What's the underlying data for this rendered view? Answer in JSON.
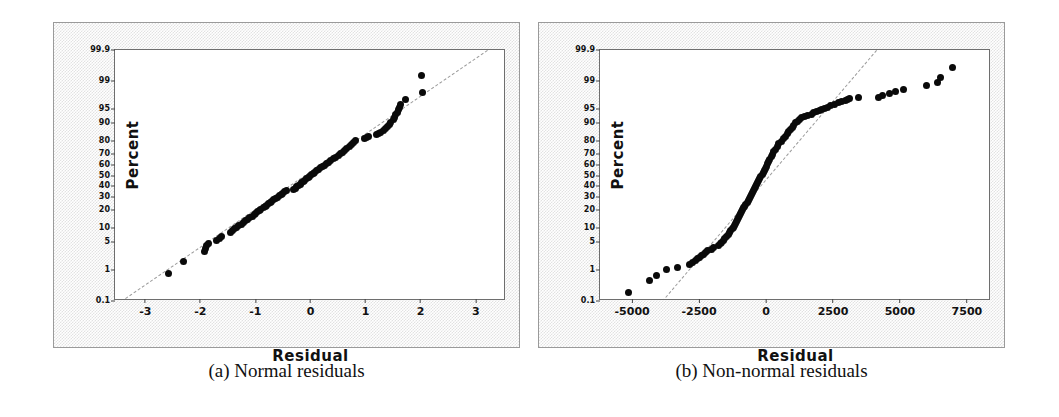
{
  "figure": {
    "panels": [
      {
        "id": "a",
        "caption": "(a) Normal residuals",
        "xlabel": "Residual",
        "ylabel": "Percent"
      },
      {
        "id": "b",
        "caption": "(b) Non-normal residuals",
        "xlabel": "Residual",
        "ylabel": "Percent"
      }
    ]
  },
  "chart_data": [
    {
      "type": "scatter",
      "subplot": "a",
      "title": "(a) Normal residuals",
      "xlabel": "Residual",
      "ylabel": "Percent",
      "xlim": [
        -3.55,
        3.55
      ],
      "ylim": [
        0.1,
        99.9
      ],
      "yscale": "normal-probability",
      "grid": false,
      "legend": null,
      "xticks": [
        -3,
        -2,
        -1,
        0,
        1,
        2,
        3
      ],
      "xticklabels": [
        "-3",
        "-2",
        "-1",
        "0",
        "1",
        "2",
        "3"
      ],
      "yticks": [
        0.1,
        1,
        5,
        10,
        20,
        30,
        40,
        50,
        60,
        70,
        80,
        90,
        95,
        99,
        99.9
      ],
      "yticklabels": [
        "0.1",
        "1",
        "5",
        "10",
        "20",
        "30",
        "40",
        "50",
        "60",
        "70",
        "80",
        "90",
        "95",
        "99",
        "99.9"
      ],
      "reference_line": {
        "style": "dashed",
        "color": "#9b9b9b",
        "x": [
          -3.45,
          3.2
        ],
        "y": [
          0.1,
          99.9
        ]
      },
      "points": [
        {
          "x": -2.58,
          "y": 0.8
        },
        {
          "x": -2.3,
          "y": 1.7
        },
        {
          "x": -1.93,
          "y": 3.0
        },
        {
          "x": -1.9,
          "y": 3.6
        },
        {
          "x": -1.88,
          "y": 4.2
        },
        {
          "x": -1.86,
          "y": 4.6
        },
        {
          "x": -1.7,
          "y": 5.6
        },
        {
          "x": -1.66,
          "y": 6.1
        },
        {
          "x": -1.62,
          "y": 6.6
        },
        {
          "x": -1.45,
          "y": 8.2
        },
        {
          "x": -1.42,
          "y": 8.8
        },
        {
          "x": -1.38,
          "y": 9.4
        },
        {
          "x": -1.34,
          "y": 10.1
        },
        {
          "x": -1.3,
          "y": 10.8
        },
        {
          "x": -1.26,
          "y": 11.6
        },
        {
          "x": -1.22,
          "y": 12.4
        },
        {
          "x": -1.18,
          "y": 13.2
        },
        {
          "x": -1.14,
          "y": 14.0
        },
        {
          "x": -1.1,
          "y": 14.9
        },
        {
          "x": -1.06,
          "y": 15.8
        },
        {
          "x": -1.02,
          "y": 16.7
        },
        {
          "x": -0.99,
          "y": 17.6
        },
        {
          "x": -0.96,
          "y": 18.5
        },
        {
          "x": -0.93,
          "y": 19.4
        },
        {
          "x": -0.9,
          "y": 20.3
        },
        {
          "x": -0.86,
          "y": 21.3
        },
        {
          "x": -0.82,
          "y": 22.3
        },
        {
          "x": -0.79,
          "y": 23.3
        },
        {
          "x": -0.76,
          "y": 24.3
        },
        {
          "x": -0.73,
          "y": 25.4
        },
        {
          "x": -0.7,
          "y": 26.4
        },
        {
          "x": -0.67,
          "y": 27.5
        },
        {
          "x": -0.64,
          "y": 28.6
        },
        {
          "x": -0.6,
          "y": 29.7
        },
        {
          "x": -0.57,
          "y": 30.8
        },
        {
          "x": -0.53,
          "y": 32.0
        },
        {
          "x": -0.5,
          "y": 33.1
        },
        {
          "x": -0.47,
          "y": 34.3
        },
        {
          "x": -0.44,
          "y": 35.5
        },
        {
          "x": -0.3,
          "y": 36.7
        },
        {
          "x": -0.28,
          "y": 37.9
        },
        {
          "x": -0.26,
          "y": 39.1
        },
        {
          "x": -0.22,
          "y": 40.3
        },
        {
          "x": -0.19,
          "y": 41.6
        },
        {
          "x": -0.16,
          "y": 42.8
        },
        {
          "x": -0.13,
          "y": 44.1
        },
        {
          "x": -0.1,
          "y": 45.4
        },
        {
          "x": -0.07,
          "y": 46.7
        },
        {
          "x": -0.04,
          "y": 48.0
        },
        {
          "x": -0.01,
          "y": 49.3
        },
        {
          "x": 0.02,
          "y": 50.6
        },
        {
          "x": 0.05,
          "y": 52.0
        },
        {
          "x": 0.08,
          "y": 53.3
        },
        {
          "x": 0.11,
          "y": 54.7
        },
        {
          "x": 0.15,
          "y": 56.0
        },
        {
          "x": 0.18,
          "y": 57.4
        },
        {
          "x": 0.21,
          "y": 58.8
        },
        {
          "x": 0.25,
          "y": 60.2
        },
        {
          "x": 0.29,
          "y": 61.6
        },
        {
          "x": 0.33,
          "y": 63.0
        },
        {
          "x": 0.37,
          "y": 64.4
        },
        {
          "x": 0.41,
          "y": 65.9
        },
        {
          "x": 0.45,
          "y": 67.3
        },
        {
          "x": 0.5,
          "y": 68.8
        },
        {
          "x": 0.54,
          "y": 70.3
        },
        {
          "x": 0.58,
          "y": 71.8
        },
        {
          "x": 0.62,
          "y": 73.3
        },
        {
          "x": 0.66,
          "y": 74.8
        },
        {
          "x": 0.7,
          "y": 76.4
        },
        {
          "x": 0.74,
          "y": 77.9
        },
        {
          "x": 0.78,
          "y": 79.5
        },
        {
          "x": 0.82,
          "y": 80.6
        },
        {
          "x": 0.98,
          "y": 81.6
        },
        {
          "x": 1.02,
          "y": 82.4
        },
        {
          "x": 1.06,
          "y": 83.2
        },
        {
          "x": 1.2,
          "y": 84.2
        },
        {
          "x": 1.24,
          "y": 84.9
        },
        {
          "x": 1.28,
          "y": 85.7
        },
        {
          "x": 1.33,
          "y": 86.8
        },
        {
          "x": 1.36,
          "y": 87.7
        },
        {
          "x": 1.4,
          "y": 88.6
        },
        {
          "x": 1.43,
          "y": 89.6
        },
        {
          "x": 1.46,
          "y": 90.5
        },
        {
          "x": 1.5,
          "y": 91.5
        },
        {
          "x": 1.53,
          "y": 92.4
        },
        {
          "x": 1.55,
          "y": 93.2
        },
        {
          "x": 1.58,
          "y": 94.1
        },
        {
          "x": 1.6,
          "y": 94.8
        },
        {
          "x": 1.62,
          "y": 95.4
        },
        {
          "x": 1.64,
          "y": 96.0
        },
        {
          "x": 1.72,
          "y": 97.0
        },
        {
          "x": 2.03,
          "y": 98.0
        },
        {
          "x": 2.02,
          "y": 99.3
        }
      ]
    },
    {
      "type": "scatter",
      "subplot": "b",
      "title": "(b) Non-normal residuals",
      "xlabel": "Residual",
      "ylabel": "Percent",
      "xlim": [
        -6200,
        8400
      ],
      "ylim": [
        0.1,
        99.9
      ],
      "yscale": "normal-probability",
      "grid": false,
      "legend": null,
      "xticks": [
        -5000,
        -2500,
        0,
        2500,
        5000,
        7500
      ],
      "xticklabels": [
        "-5000",
        "-2500",
        "0",
        "2500",
        "5000",
        "7500"
      ],
      "yticks": [
        0.1,
        1,
        5,
        10,
        20,
        30,
        40,
        50,
        60,
        70,
        80,
        90,
        95,
        99,
        99.9
      ],
      "yticklabels": [
        "0.1",
        "1",
        "5",
        "10",
        "20",
        "30",
        "40",
        "50",
        "60",
        "70",
        "80",
        "90",
        "95",
        "99",
        "99.9"
      ],
      "reference_line": {
        "style": "dashed",
        "color": "#9b9b9b",
        "x": [
          -3900,
          4100
        ],
        "y": [
          0.1,
          99.9
        ]
      },
      "points": [
        {
          "x": -5150,
          "y": 0.2
        },
        {
          "x": -4350,
          "y": 0.5
        },
        {
          "x": -4100,
          "y": 0.7
        },
        {
          "x": -3700,
          "y": 1.0
        },
        {
          "x": -3300,
          "y": 1.2
        },
        {
          "x": -2850,
          "y": 1.4
        },
        {
          "x": -2750,
          "y": 1.6
        },
        {
          "x": -2650,
          "y": 1.8
        },
        {
          "x": -2560,
          "y": 2.0
        },
        {
          "x": -2480,
          "y": 2.2
        },
        {
          "x": -2400,
          "y": 2.4
        },
        {
          "x": -2330,
          "y": 2.6
        },
        {
          "x": -2260,
          "y": 2.9
        },
        {
          "x": -2180,
          "y": 3.2
        },
        {
          "x": -2050,
          "y": 3.5
        },
        {
          "x": -1960,
          "y": 3.8
        },
        {
          "x": -1760,
          "y": 4.2
        },
        {
          "x": -1700,
          "y": 4.6
        },
        {
          "x": -1660,
          "y": 5.0
        },
        {
          "x": -1600,
          "y": 5.5
        },
        {
          "x": -1540,
          "y": 6.0
        },
        {
          "x": -1480,
          "y": 6.6
        },
        {
          "x": -1420,
          "y": 7.2
        },
        {
          "x": -1370,
          "y": 7.9
        },
        {
          "x": -1320,
          "y": 8.6
        },
        {
          "x": -1270,
          "y": 9.4
        },
        {
          "x": -1230,
          "y": 10.2
        },
        {
          "x": -1190,
          "y": 11.1
        },
        {
          "x": -1150,
          "y": 12.0
        },
        {
          "x": -1110,
          "y": 13.0
        },
        {
          "x": -1070,
          "y": 14.0
        },
        {
          "x": -1030,
          "y": 15.1
        },
        {
          "x": -990,
          "y": 16.2
        },
        {
          "x": -950,
          "y": 17.4
        },
        {
          "x": -910,
          "y": 18.6
        },
        {
          "x": -870,
          "y": 19.9
        },
        {
          "x": -830,
          "y": 21.2
        },
        {
          "x": -790,
          "y": 22.6
        },
        {
          "x": -750,
          "y": 24.0
        },
        {
          "x": -710,
          "y": 25.5
        },
        {
          "x": -670,
          "y": 27.0
        },
        {
          "x": -630,
          "y": 28.6
        },
        {
          "x": -590,
          "y": 30.2
        },
        {
          "x": -550,
          "y": 31.9
        },
        {
          "x": -510,
          "y": 33.6
        },
        {
          "x": -470,
          "y": 35.4
        },
        {
          "x": -430,
          "y": 37.2
        },
        {
          "x": -390,
          "y": 39.0
        },
        {
          "x": -350,
          "y": 40.9
        },
        {
          "x": -310,
          "y": 42.8
        },
        {
          "x": -270,
          "y": 44.8
        },
        {
          "x": -230,
          "y": 46.8
        },
        {
          "x": -190,
          "y": 48.8
        },
        {
          "x": -150,
          "y": 50.8
        },
        {
          "x": -110,
          "y": 52.9
        },
        {
          "x": -70,
          "y": 55.0
        },
        {
          "x": -30,
          "y": 57.1
        },
        {
          "x": 10,
          "y": 59.2
        },
        {
          "x": 50,
          "y": 61.3
        },
        {
          "x": 90,
          "y": 63.5
        },
        {
          "x": 140,
          "y": 65.6
        },
        {
          "x": 190,
          "y": 67.8
        },
        {
          "x": 240,
          "y": 69.9
        },
        {
          "x": 290,
          "y": 72.0
        },
        {
          "x": 350,
          "y": 74.1
        },
        {
          "x": 410,
          "y": 76.2
        },
        {
          "x": 480,
          "y": 78.2
        },
        {
          "x": 560,
          "y": 80.1
        },
        {
          "x": 650,
          "y": 81.8
        },
        {
          "x": 720,
          "y": 83.3
        },
        {
          "x": 790,
          "y": 84.7
        },
        {
          "x": 850,
          "y": 86.0
        },
        {
          "x": 910,
          "y": 87.2
        },
        {
          "x": 970,
          "y": 88.3
        },
        {
          "x": 1030,
          "y": 89.3
        },
        {
          "x": 1090,
          "y": 90.2
        },
        {
          "x": 1160,
          "y": 91.0
        },
        {
          "x": 1240,
          "y": 91.7
        },
        {
          "x": 1330,
          "y": 92.3
        },
        {
          "x": 1430,
          "y": 92.7
        },
        {
          "x": 1560,
          "y": 93.1
        },
        {
          "x": 1680,
          "y": 93.5
        },
        {
          "x": 1790,
          "y": 93.9
        },
        {
          "x": 1880,
          "y": 94.2
        },
        {
          "x": 1990,
          "y": 94.5
        },
        {
          "x": 2080,
          "y": 94.8
        },
        {
          "x": 2180,
          "y": 95.1
        },
        {
          "x": 2300,
          "y": 95.4
        },
        {
          "x": 2420,
          "y": 95.7
        },
        {
          "x": 2560,
          "y": 96.0
        },
        {
          "x": 2700,
          "y": 96.3
        },
        {
          "x": 2820,
          "y": 96.5
        },
        {
          "x": 2950,
          "y": 96.7
        },
        {
          "x": 3050,
          "y": 96.9
        },
        {
          "x": 3120,
          "y": 97.1
        },
        {
          "x": 3450,
          "y": 97.2
        },
        {
          "x": 4200,
          "y": 97.3
        },
        {
          "x": 4330,
          "y": 97.5
        },
        {
          "x": 4600,
          "y": 97.8
        },
        {
          "x": 4850,
          "y": 98.1
        },
        {
          "x": 5120,
          "y": 98.3
        },
        {
          "x": 6000,
          "y": 98.7
        },
        {
          "x": 6400,
          "y": 98.9
        },
        {
          "x": 6500,
          "y": 99.2
        },
        {
          "x": 6980,
          "y": 99.6
        }
      ]
    }
  ]
}
